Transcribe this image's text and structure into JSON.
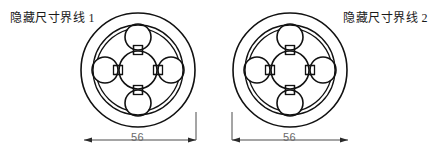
{
  "page": {
    "width": 433,
    "height": 165,
    "background": "#ffffff",
    "line_color": "#111111",
    "dimension_color": "#4a4a4a",
    "dimension_text_color": "#6a6a6a"
  },
  "figures": [
    {
      "id": "figure-left",
      "label": "隐藏尺寸界线 1",
      "dimension_value": "56",
      "extension_line_side": "right",
      "center_x": 138,
      "center_y": 70,
      "outer_diameter_px": 115
    },
    {
      "id": "figure-right",
      "label": "隐藏尺寸界线 2",
      "dimension_value": "56",
      "extension_line_side": "left",
      "center_x": 290,
      "center_y": 70,
      "outer_diameter_px": 115
    }
  ],
  "geometry": {
    "outer_circle_r": 57,
    "ring_circle_r": 45,
    "hub_circle_r": 19,
    "satellite_circle_r": 13,
    "satellite_offset": 33,
    "connector_size": 9
  }
}
